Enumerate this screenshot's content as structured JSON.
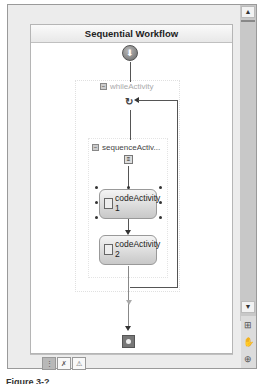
{
  "designer": {
    "title": "Sequential Workflow",
    "while_activity": {
      "label": "whileActivity",
      "collapse_glyph": "−"
    },
    "sequence_activity": {
      "label": "sequenceActiv...",
      "collapse_glyph": "−"
    },
    "code_activities": [
      {
        "label": "codeActivity 1",
        "line1": "codeActivity",
        "line2": "1",
        "selected": true
      },
      {
        "label": "codeActivity 2",
        "line1": "codeActivity",
        "line2": "2",
        "selected": false
      }
    ],
    "start_glyph": "⬇",
    "loop_glyph": "↻",
    "seq_glyph": "≡"
  },
  "scrollbar": {
    "up_glyph": "▲",
    "down_glyph": "▼"
  },
  "side_tools": [
    {
      "name": "zoom-in",
      "glyph": "⊞"
    },
    {
      "name": "pan",
      "glyph": "✋"
    },
    {
      "name": "zoom-fit",
      "glyph": "⊕"
    }
  ],
  "view_tabs": [
    {
      "name": "workflow-view",
      "glyph": "⋮",
      "active": true
    },
    {
      "name": "cancel-handler-view",
      "glyph": "✗"
    },
    {
      "name": "fault-handlers-view",
      "glyph": "⚠"
    }
  ],
  "caption": "Figure 3-?"
}
